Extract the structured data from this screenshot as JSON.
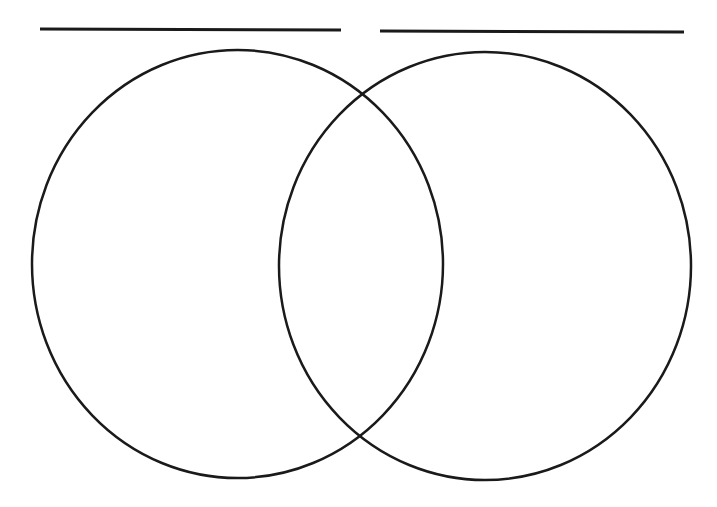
{
  "diagram": {
    "type": "venn",
    "set_count": 2,
    "stroke_color": "#1a1a1a",
    "background_color": "#ffffff",
    "title_lines": [
      {
        "name": "left-set-title-line",
        "text": "",
        "x1": 40,
        "y1": 29,
        "x2": 341,
        "y2": 30
      },
      {
        "name": "right-set-title-line",
        "text": "",
        "x1": 380,
        "y1": 31,
        "x2": 684,
        "y2": 32
      }
    ],
    "sets": [
      {
        "name": "left-set",
        "label": "",
        "cx": 237.5,
        "cy": 264,
        "rx": 205.5,
        "ry": 214
      },
      {
        "name": "right-set",
        "label": "",
        "cx": 485,
        "cy": 266,
        "rx": 206,
        "ry": 214
      }
    ],
    "regions": {
      "left_only": "",
      "overlap": "",
      "right_only": ""
    }
  }
}
